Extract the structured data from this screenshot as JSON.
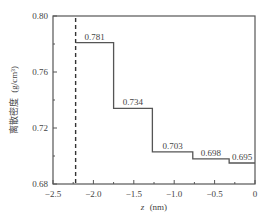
{
  "chart_data": {
    "type": "line",
    "subtype": "step",
    "title": "",
    "xlabel": "z (nm)",
    "xlabel_var": "z",
    "xlabel_unit": "(nm)",
    "ylabel": "离散密度 (g/cm³)",
    "ylabel_text": "离散密度",
    "ylabel_unit": "(g/cm³)",
    "xlim": [
      -2.5,
      0
    ],
    "ylim": [
      0.68,
      0.8
    ],
    "xticks": [
      -2.5,
      -2.0,
      -1.5,
      -1.0,
      -0.5,
      0
    ],
    "xtick_labels": [
      "−2.5",
      "−2.0",
      "−1.5",
      "−1.0",
      "−0.5",
      "0"
    ],
    "xminor_ticks": [
      -2.25,
      -1.75,
      -1.25,
      -0.75,
      -0.25
    ],
    "yticks": [
      0.68,
      0.72,
      0.76,
      0.8
    ],
    "ytick_labels": [
      "0.68",
      "0.72",
      "0.76",
      "0.80"
    ],
    "yminor_ticks": [
      0.7,
      0.74,
      0.78
    ],
    "grid": false,
    "legend": null,
    "dashed_vline_x": -2.22,
    "segments": [
      {
        "x_start": -2.22,
        "x_end": -1.75,
        "value": 0.781,
        "label": "0.781"
      },
      {
        "x_start": -1.75,
        "x_end": -1.27,
        "value": 0.734,
        "label": "0.734"
      },
      {
        "x_start": -1.27,
        "x_end": -0.77,
        "value": 0.703,
        "label": "0.703"
      },
      {
        "x_start": -0.77,
        "x_end": -0.32,
        "value": 0.698,
        "label": "0.698"
      },
      {
        "x_start": -0.32,
        "x_end": 0.0,
        "value": 0.695,
        "label": "0.695"
      }
    ],
    "colors": {
      "line": "#555555",
      "axis": "#555555",
      "dashed": "#333333"
    }
  }
}
